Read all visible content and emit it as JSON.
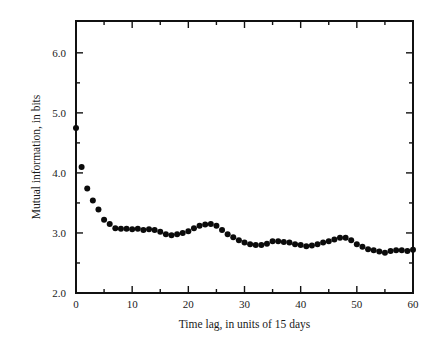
{
  "figure": {
    "name": "mutual-information-vs-time-lag",
    "background": "#ffffff",
    "ink_color": "#111111"
  },
  "chart_data": {
    "type": "scatter",
    "title": "",
    "xlabel": "Time lag, in units of 15 days",
    "ylabel": "Mutual information, in bits",
    "xlim": [
      0,
      60
    ],
    "ylim": [
      2.0,
      6.53
    ],
    "grid": false,
    "legend": null,
    "marker": "filled-circle",
    "marker_color": "#0b0b0b",
    "marker_size_px": 4.2,
    "xticks": [
      0,
      10,
      20,
      30,
      40,
      50,
      60
    ],
    "xtick_labels": [
      "0",
      "10",
      "20",
      "30",
      "40",
      "50",
      "60"
    ],
    "xticks_minor": [
      5,
      15,
      25,
      35,
      45,
      55
    ],
    "yticks": [
      2.0,
      3.0,
      4.0,
      5.0,
      6.0
    ],
    "ytick_labels": [
      "2.0",
      "3.0",
      "4.0",
      "5.0",
      "6.0"
    ],
    "yticks_minor": [
      2.5,
      3.5,
      4.5,
      5.5
    ],
    "x": [
      0,
      1,
      2,
      3,
      4,
      5,
      6,
      7,
      8,
      9,
      10,
      11,
      12,
      13,
      14,
      15,
      16,
      17,
      18,
      19,
      20,
      21,
      22,
      23,
      24,
      25,
      26,
      27,
      28,
      29,
      30,
      31,
      32,
      33,
      34,
      35,
      36,
      37,
      38,
      39,
      40,
      41,
      42,
      43,
      44,
      45,
      46,
      47,
      48,
      49,
      50,
      51,
      52,
      53,
      54,
      55,
      56,
      57,
      58,
      59,
      60
    ],
    "values": [
      4.75,
      4.1,
      3.74,
      3.54,
      3.39,
      3.22,
      3.15,
      3.08,
      3.07,
      3.07,
      3.06,
      3.07,
      3.05,
      3.06,
      3.05,
      3.02,
      2.98,
      2.96,
      2.98,
      3.0,
      3.03,
      3.08,
      3.12,
      3.14,
      3.15,
      3.12,
      3.05,
      2.98,
      2.93,
      2.88,
      2.84,
      2.81,
      2.8,
      2.8,
      2.82,
      2.86,
      2.86,
      2.85,
      2.84,
      2.81,
      2.8,
      2.78,
      2.79,
      2.81,
      2.84,
      2.86,
      2.89,
      2.92,
      2.92,
      2.88,
      2.81,
      2.77,
      2.73,
      2.71,
      2.69,
      2.67,
      2.7,
      2.71,
      2.71,
      2.7,
      2.72
    ]
  }
}
